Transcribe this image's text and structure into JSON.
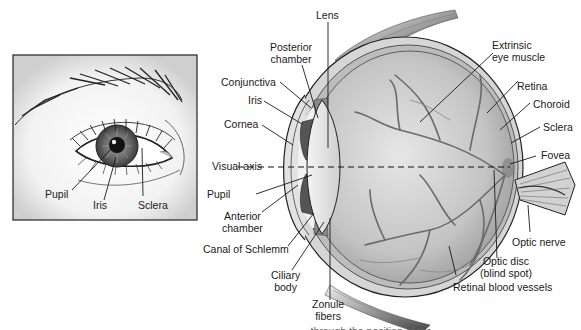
{
  "figure": {
    "type": "anatomical-diagram",
    "colors": {
      "line": "#1a1a1a",
      "sclera_fill": "#d9d9d9",
      "vitreous_fill": "#bdbdbd",
      "vessel": "#6e6e6e",
      "iris_dark": "#4a4a4a",
      "background": "#ffffff"
    }
  },
  "external_view": {
    "labels": {
      "pupil": "Pupil",
      "iris": "Iris",
      "sclera": "Sclera"
    }
  },
  "cross_section": {
    "labels": {
      "lens": "Lens",
      "posterior_chamber": "Posterior\nchamber",
      "conjunctiva": "Conjunctiva",
      "iris": "Iris",
      "cornea": "Cornea",
      "visual_axis": "Visual axis",
      "pupil": "Pupil",
      "anterior_chamber": "Anterior\nchamber",
      "canal_of_schlemm": "Canal of Schlemm",
      "ciliary_body": "Ciliary\nbody",
      "zonule_fibers": "Zonule\nfibers",
      "extrinsic_eye_muscle": "Extrinsic\neye muscle",
      "retina": "Retina",
      "choroid": "Choroid",
      "sclera": "Sclera",
      "fovea": "Fovea",
      "optic_nerve": "Optic nerve",
      "optic_disc": "Optic disc\n(blind spot)",
      "retinal_blood_vessels": "Retinal blood vessels"
    }
  },
  "caption_cut": "…through the position of the…"
}
